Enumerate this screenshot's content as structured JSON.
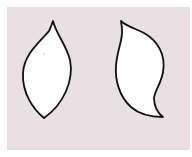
{
  "image": {
    "description": "Two hand-drawn leaf / petal outlines on a pale pink background",
    "background_color": "#e9e0e3",
    "margin_color": "#ffffff",
    "stroke_color": "#111111",
    "fill_color": "#ffffff"
  },
  "shapes": [
    {
      "name": "symmetric-leaf",
      "kind": "pointed oval leaf",
      "top_tip": [
        53,
        21
      ],
      "bottom_tip": [
        44,
        118
      ]
    },
    {
      "name": "curved-leaf",
      "kind": "S-curved petal",
      "top_tip": [
        121,
        21
      ],
      "bottom_tip": [
        163,
        117
      ]
    }
  ]
}
